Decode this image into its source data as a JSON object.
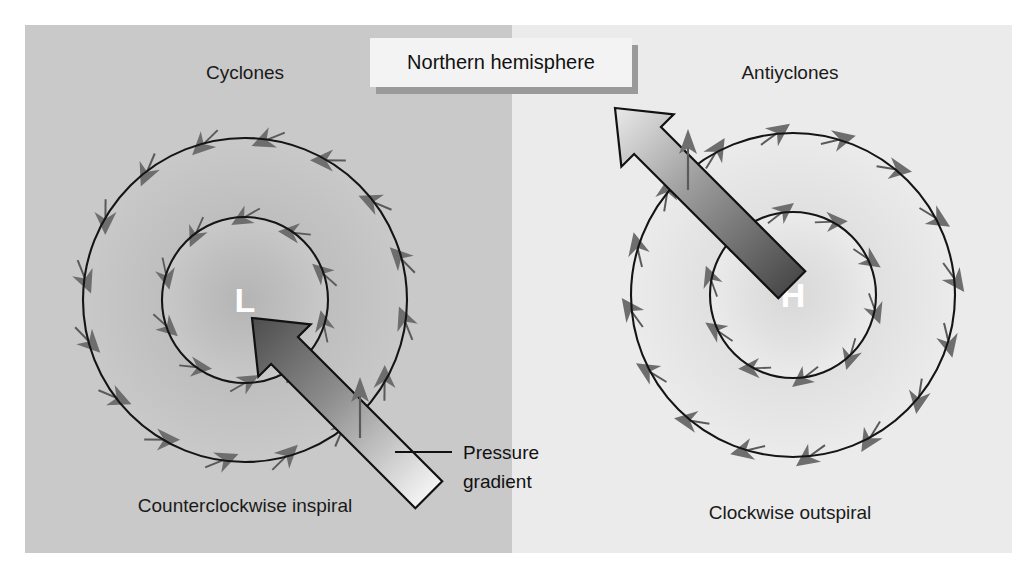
{
  "figure": {
    "title_banner": "Northern hemisphere",
    "canvas": {
      "width": 1035,
      "height": 581
    },
    "panel": {
      "x": 25,
      "y": 25,
      "width": 987,
      "height": 528
    },
    "split_x": 512,
    "colors": {
      "left_panel_bg": "#c9c9c9",
      "right_panel_bg": "#ebebeb",
      "page_bg": "#ffffff",
      "isobar_stroke": "#151515",
      "wind_arrow_fill": "#6e6e6e",
      "wind_arrow_tail": "#5a5a5a",
      "gradient_arrow_dark": "#4a4a4a",
      "gradient_arrow_light": "#f2f2f2",
      "gradient_arrow_outline": "#111111",
      "banner_fill": "#f3f3f3",
      "banner_shadow": "#9a9a9a",
      "center_letter": "#ffffff",
      "label_text": "#1a1a1a"
    }
  },
  "left_panel": {
    "heading": "Cyclones",
    "center_symbol": "L",
    "caption": "Counterclockwise inspiral",
    "center": {
      "x": 245,
      "y": 300
    },
    "outer_radius": 162,
    "inner_radius": 83,
    "rotation": "counterclockwise",
    "flow": "inward",
    "outer_arrow_count": 16,
    "inner_arrow_count": 10,
    "gradient_arrow": {
      "label_line1": "Pressure",
      "label_line2": "gradient",
      "direction": "points toward low center (up-left)",
      "tip": {
        "x": 252,
        "y": 318
      },
      "tail": {
        "x": 428,
        "y": 496
      }
    }
  },
  "right_panel": {
    "heading": "Antiyclones",
    "center_symbol": "H",
    "caption": "Clockwise outspiral",
    "center": {
      "x": 793,
      "y": 295
    },
    "outer_radius": 162,
    "inner_radius": 83,
    "rotation": "clockwise",
    "flow": "outward",
    "outer_arrow_count": 16,
    "inner_arrow_count": 10,
    "gradient_arrow": {
      "direction": "points away from high center (up-left)",
      "tip": {
        "x": 612,
        "y": 106
      },
      "tail": {
        "x": 800,
        "y": 278
      }
    }
  },
  "chart_data": {
    "type": "diagram",
    "title": "Northern hemisphere",
    "panels": [
      {
        "name": "Cyclones",
        "center_symbol": "L",
        "caption": "Counterclockwise inspiral",
        "circulation": "counterclockwise",
        "radial_component": "inflow",
        "isobars": 2,
        "pressure_gradient_direction": "toward center"
      },
      {
        "name": "Antiyclones",
        "center_symbol": "H",
        "caption": "Clockwise outspiral",
        "circulation": "clockwise",
        "radial_component": "outflow",
        "isobars": 2,
        "pressure_gradient_direction": "away from center"
      }
    ],
    "annotations": [
      "Pressure gradient"
    ]
  }
}
